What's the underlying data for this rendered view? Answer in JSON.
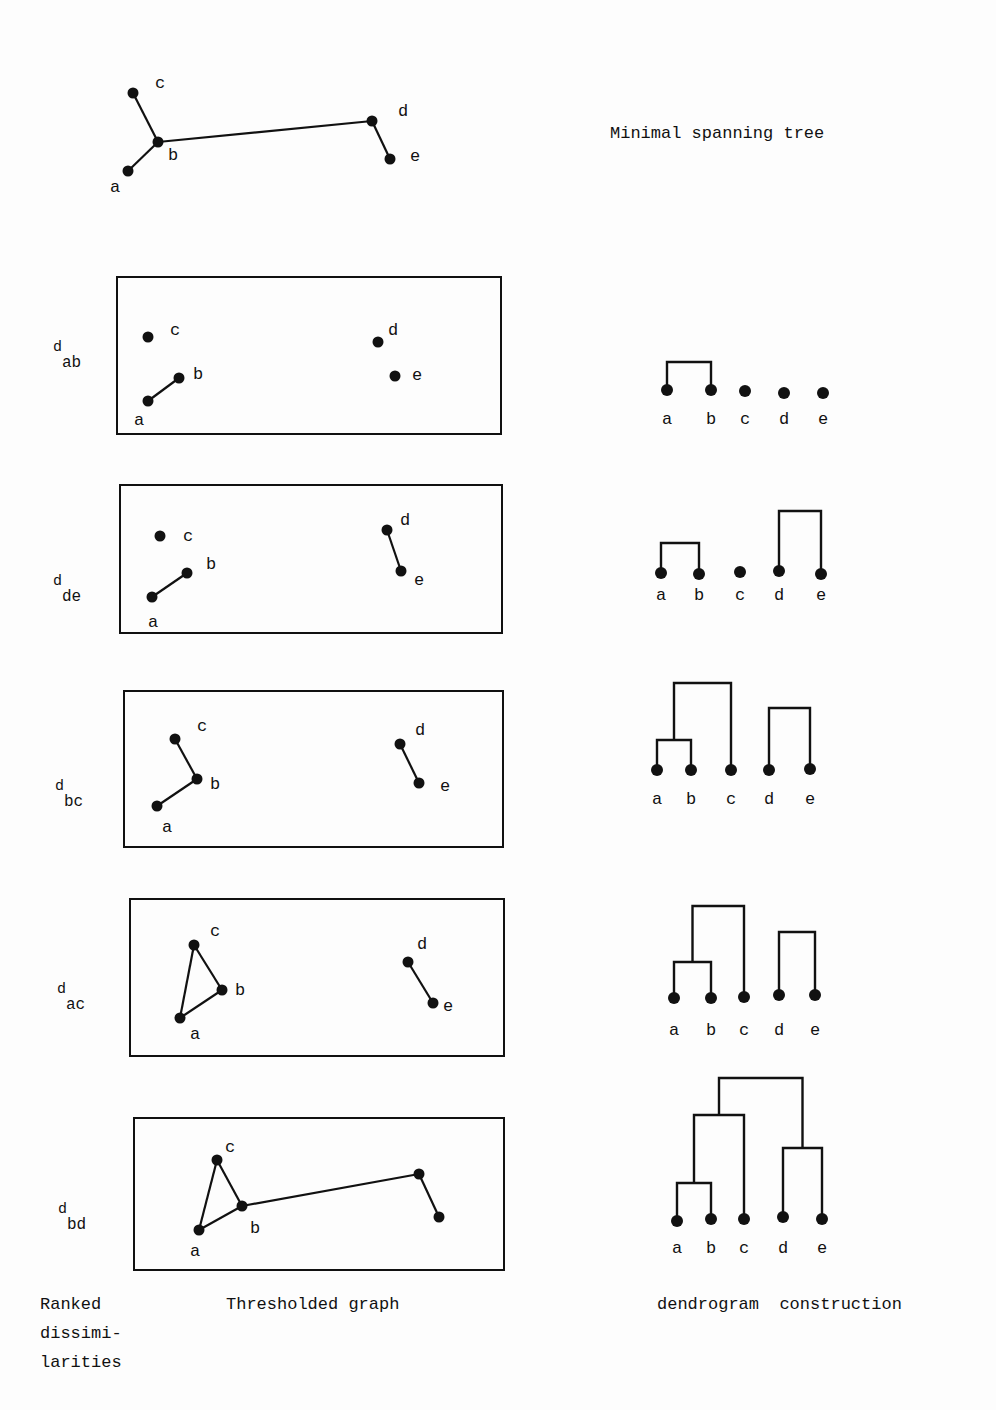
{
  "title": "Minimal spanning tree",
  "footer": {
    "col1": [
      "Ranked",
      "dissimi-",
      "larities"
    ],
    "col2": "Thresholded graph",
    "col3": "dendrogram  construction"
  },
  "mst": {
    "nodes": {
      "a": [
        128,
        171
      ],
      "b": [
        158,
        142
      ],
      "c": [
        133,
        93
      ],
      "d": [
        372,
        121
      ],
      "e": [
        390,
        159
      ]
    },
    "labels": {
      "a": [
        110,
        192
      ],
      "b": [
        168,
        160
      ],
      "c": [
        155,
        88
      ],
      "d": [
        398,
        116
      ],
      "e": [
        410,
        161
      ]
    },
    "edges": [
      [
        "a",
        "b"
      ],
      [
        "b",
        "c"
      ],
      [
        "b",
        "d"
      ],
      [
        "d",
        "e"
      ]
    ]
  },
  "panels": [
    {
      "threshold": {
        "d": "d",
        "sub": "ab"
      },
      "label_pos": [
        53,
        338
      ],
      "box": [
        117,
        277,
        501,
        434
      ],
      "nodes": {
        "a": [
          148,
          401
        ],
        "b": [
          179,
          378
        ],
        "c": [
          148,
          337
        ],
        "d": [
          378,
          342
        ],
        "e": [
          395,
          376
        ]
      },
      "labels": {
        "a": [
          134,
          425
        ],
        "b": [
          193,
          379
        ],
        "c": [
          170,
          335
        ],
        "d": [
          388,
          335
        ],
        "e": [
          412,
          380
        ]
      },
      "edges": [
        [
          "a",
          "b"
        ]
      ],
      "dendro": {
        "leaves": {
          "a": [
            667,
            390
          ],
          "b": [
            711,
            390
          ],
          "c": [
            745,
            391
          ],
          "d": [
            784,
            393
          ],
          "e": [
            823,
            393
          ]
        },
        "leaf_label_y": 424,
        "links": [
          [
            [
              "a",
              "b"
            ],
            362
          ]
        ]
      }
    },
    {
      "threshold": {
        "d": "d",
        "sub": "de"
      },
      "label_pos": [
        53,
        572
      ],
      "box": [
        120,
        485,
        502,
        633
      ],
      "nodes": {
        "a": [
          152,
          597
        ],
        "b": [
          187,
          573
        ],
        "c": [
          160,
          536
        ],
        "d": [
          387,
          530
        ],
        "e": [
          401,
          571
        ]
      },
      "labels": {
        "a": [
          148,
          627
        ],
        "b": [
          206,
          569
        ],
        "c": [
          183,
          541
        ],
        "d": [
          400,
          525
        ],
        "e": [
          414,
          585
        ]
      },
      "edges": [
        [
          "a",
          "b"
        ],
        [
          "d",
          "e"
        ]
      ],
      "dendro": {
        "leaves": {
          "a": [
            661,
            573
          ],
          "b": [
            699,
            574
          ],
          "c": [
            740,
            572
          ],
          "d": [
            779,
            571
          ],
          "e": [
            821,
            574
          ]
        },
        "leaf_label_y": 600,
        "links": [
          [
            [
              "a",
              "b"
            ],
            543
          ],
          [
            [
              "d",
              "e"
            ],
            511
          ]
        ]
      }
    },
    {
      "threshold": {
        "d": "d",
        "sub": "bc"
      },
      "label_pos": [
        55,
        777
      ],
      "box": [
        124,
        691,
        503,
        847
      ],
      "nodes": {
        "a": [
          157,
          806
        ],
        "b": [
          197,
          779
        ],
        "c": [
          175,
          739
        ],
        "d": [
          400,
          744
        ],
        "e": [
          419,
          783
        ]
      },
      "labels": {
        "a": [
          162,
          832
        ],
        "b": [
          210,
          789
        ],
        "c": [
          197,
          731
        ],
        "d": [
          415,
          735
        ],
        "e": [
          440,
          791
        ]
      },
      "edges": [
        [
          "a",
          "b"
        ],
        [
          "b",
          "c"
        ],
        [
          "d",
          "e"
        ]
      ],
      "dendro": {
        "leaves": {
          "a": [
            657,
            770
          ],
          "b": [
            691,
            770
          ],
          "c": [
            731,
            770
          ],
          "d": [
            769,
            770
          ],
          "e": [
            810,
            769
          ]
        },
        "leaf_label_y": 804,
        "links": [
          [
            [
              "a",
              "b"
            ],
            740
          ],
          [
            [
              "ab",
              "c"
            ],
            683
          ],
          [
            [
              "d",
              "e"
            ],
            708
          ]
        ]
      }
    },
    {
      "threshold": {
        "d": "d",
        "sub": "ac"
      },
      "label_pos": [
        57,
        980
      ],
      "box": [
        130,
        899,
        504,
        1056
      ],
      "nodes": {
        "a": [
          180,
          1018
        ],
        "b": [
          222,
          990
        ],
        "c": [
          194,
          945
        ],
        "d": [
          408,
          962
        ],
        "e": [
          433,
          1003
        ]
      },
      "labels": {
        "a": [
          190,
          1039
        ],
        "b": [
          235,
          995
        ],
        "c": [
          210,
          936
        ],
        "d": [
          417,
          949
        ],
        "e": [
          443,
          1011
        ]
      },
      "edges": [
        [
          "a",
          "b"
        ],
        [
          "b",
          "c"
        ],
        [
          "a",
          "c"
        ],
        [
          "d",
          "e"
        ]
      ],
      "dendro": {
        "leaves": {
          "a": [
            674,
            998
          ],
          "b": [
            711,
            998
          ],
          "c": [
            744,
            997
          ],
          "d": [
            779,
            995
          ],
          "e": [
            815,
            995
          ]
        },
        "leaf_label_y": 1035,
        "links": [
          [
            [
              "a",
              "b"
            ],
            962
          ],
          [
            [
              "ab",
              "c"
            ],
            906
          ],
          [
            [
              "d",
              "e"
            ],
            932
          ]
        ]
      }
    },
    {
      "threshold": {
        "d": "d",
        "sub": "bd"
      },
      "label_pos": [
        58,
        1200
      ],
      "box": [
        134,
        1118,
        504,
        1270
      ],
      "nodes": {
        "a": [
          199,
          1230
        ],
        "b": [
          242,
          1206
        ],
        "c": [
          217,
          1160
        ],
        "d": [
          419,
          1174
        ],
        "e": [
          439,
          1217
        ]
      },
      "labels": {
        "a": [
          190,
          1256
        ],
        "b": [
          250,
          1233
        ],
        "c": [
          225,
          1152
        ]
      },
      "edges": [
        [
          "a",
          "b"
        ],
        [
          "b",
          "c"
        ],
        [
          "a",
          "c"
        ],
        [
          "b",
          "d"
        ],
        [
          "d",
          "e"
        ]
      ],
      "dendro": {
        "leaves": {
          "a": [
            677,
            1221
          ],
          "b": [
            711,
            1219
          ],
          "c": [
            744,
            1219
          ],
          "d": [
            783,
            1217
          ],
          "e": [
            822,
            1219
          ]
        },
        "leaf_label_y": 1253,
        "links": [
          [
            [
              "a",
              "b"
            ],
            1183
          ],
          [
            [
              "ab",
              "c"
            ],
            1115
          ],
          [
            [
              "d",
              "e"
            ],
            1148
          ],
          [
            [
              "abc",
              "de"
            ],
            1078
          ]
        ]
      }
    }
  ],
  "dendro_labels": [
    "a",
    "b",
    "c",
    "d",
    "e"
  ],
  "colors": {
    "ink": "#111111",
    "paper": "#fdfdfd"
  }
}
